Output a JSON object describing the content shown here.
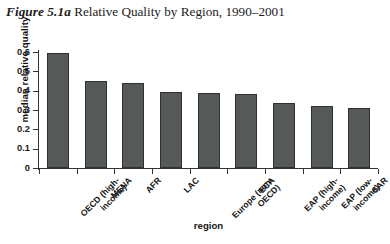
{
  "figure": {
    "number": "Figure 5.1a",
    "title": "Relative Quality by Region, 1990–2001"
  },
  "axes": {
    "xlabel": "region",
    "ylabel": "median relative quality",
    "ytick_labels": [
      "0",
      "0.1",
      "0.2",
      "0.3",
      "0.4",
      "0.5",
      "0.6"
    ]
  },
  "chart_data": {
    "type": "bar",
    "title": "Figure 5.1a Relative Quality by Region, 1990–2001",
    "xlabel": "region",
    "ylabel": "median relative quality",
    "ylim": [
      0,
      0.6
    ],
    "yticks": [
      0,
      0.1,
      0.2,
      0.3,
      0.4,
      0.5,
      0.6
    ],
    "grid": false,
    "legend": false,
    "bar_color": "#555a58",
    "bar_edge_color": "#2e3130",
    "categories": [
      "OECD (high-income)",
      "MENA",
      "AFR",
      "LAC",
      "Europe (non-OECD)",
      "ECA",
      "EAP (high-income)",
      "EAP (low-income)",
      "SAR"
    ],
    "category_lines": [
      [
        "OECD (high-",
        "income)"
      ],
      [
        "MENA"
      ],
      [
        "AFR"
      ],
      [
        "LAC"
      ],
      [
        "Europe (non-",
        "OECD)"
      ],
      [
        "ECA"
      ],
      [
        "EAP (high-",
        "income)"
      ],
      [
        "EAP (low-",
        "income)"
      ],
      [
        "SAR"
      ]
    ],
    "values": [
      0.595,
      0.45,
      0.44,
      0.395,
      0.388,
      0.385,
      0.338,
      0.322,
      0.312
    ]
  }
}
